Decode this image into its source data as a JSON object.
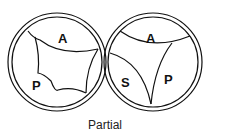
{
  "figure": {
    "caption": "Partial",
    "left_valve": {
      "labels": {
        "anterior": "A",
        "posterior": "P"
      }
    },
    "right_valve": {
      "labels": {
        "anterior": "A",
        "septal": "S",
        "posterior": "P"
      }
    },
    "colors": {
      "stroke": "#111111",
      "background": "#ffffff"
    }
  }
}
